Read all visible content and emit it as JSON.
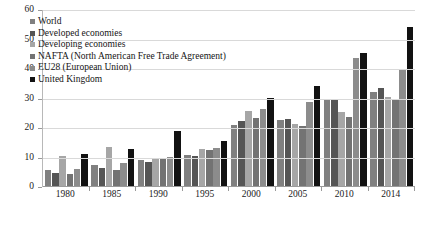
{
  "chart_data": {
    "type": "bar",
    "title": "",
    "xlabel": "",
    "ylabel": "",
    "ylim": [
      0,
      60
    ],
    "yticks": [
      0,
      10,
      20,
      30,
      40,
      50,
      60
    ],
    "grid": true,
    "legend_position": "top-left",
    "categories": [
      "1980",
      "1985",
      "1990",
      "1995",
      "2000",
      "2005",
      "2010",
      "2014"
    ],
    "series": [
      {
        "name": "World",
        "color": "#808080",
        "values": [
          5.5,
          7.3,
          9.0,
          10.5,
          20.8,
          22.5,
          29.5,
          32.0
        ]
      },
      {
        "name": "Developed economies",
        "color": "#555555",
        "values": [
          4.6,
          6.2,
          8.3,
          10.3,
          22.3,
          23.0,
          29.5,
          33.5
        ]
      },
      {
        "name": "Developing economies",
        "color": "#a6a6a6",
        "values": [
          10.4,
          13.2,
          9.6,
          12.6,
          25.5,
          21.0,
          25.2,
          30.5
        ]
      },
      {
        "name": "NAFTA (North American Free Trade Agreement)",
        "color": "#737373",
        "values": [
          4.0,
          5.5,
          9.2,
          12.3,
          23.3,
          20.5,
          23.5,
          29.8
        ]
      },
      {
        "name": "EU28 (European Union)",
        "color": "#8c8c8c",
        "values": [
          5.8,
          7.8,
          10.0,
          13.0,
          26.3,
          28.6,
          43.5,
          40.0
        ]
      },
      {
        "name": "United Kingdom",
        "color": "#121212",
        "values": [
          10.8,
          12.6,
          18.6,
          15.2,
          30.1,
          34.0,
          45.5,
          54.3
        ]
      }
    ]
  }
}
